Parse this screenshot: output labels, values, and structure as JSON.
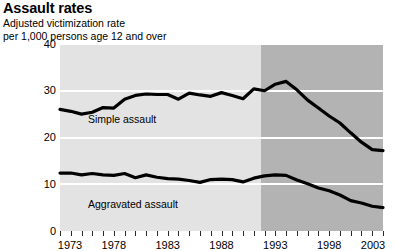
{
  "header": {
    "title": "Assault rates",
    "subtitle_line1": "Adjusted victimization rate",
    "subtitle_line2": "per 1,000 persons age 12 and over"
  },
  "series_labels": {
    "simple": "Simple assault",
    "aggravated": "Aggravated assault"
  },
  "axis": {
    "y_ticks": [
      "40",
      "30",
      "20",
      "10",
      "0"
    ],
    "x_ticks_labeled": [
      "1973",
      "1978",
      "1983",
      "1988",
      "1993",
      "1998",
      "2003"
    ]
  },
  "chart_data": {
    "type": "line",
    "title": "Assault rates",
    "subtitle": "Adjusted victimization rate per 1,000 persons age 12 and over",
    "xlabel": "",
    "ylabel": "",
    "xlim": [
      1973,
      2003
    ],
    "ylim": [
      0,
      40
    ],
    "ytick_values": [
      0,
      10,
      20,
      30,
      40
    ],
    "xtick_values": [
      1973,
      1974,
      1975,
      1976,
      1977,
      1978,
      1979,
      1980,
      1981,
      1982,
      1983,
      1984,
      1985,
      1986,
      1987,
      1988,
      1989,
      1990,
      1991,
      1992,
      1993,
      1994,
      1995,
      1996,
      1997,
      1998,
      1999,
      2000,
      2001,
      2002,
      2003
    ],
    "xtick_labels_shown": [
      1973,
      1978,
      1983,
      1988,
      1993,
      1998,
      2003
    ],
    "grid": "horizontal-white-gridlines",
    "legend": "inline-series-labels",
    "plot_background_light": "#e3e3e3",
    "plot_background_dark": "#b3b3b3",
    "shaded_region_note": "Darker band covers 1993 through 2003 (redesigned survey period)",
    "line_color": "#000000",
    "x": [
      1973,
      1974,
      1975,
      1976,
      1977,
      1978,
      1979,
      1980,
      1981,
      1982,
      1983,
      1984,
      1985,
      1986,
      1987,
      1988,
      1989,
      1990,
      1991,
      1992,
      1993,
      1994,
      1995,
      1996,
      1997,
      1998,
      1999,
      2000,
      2001,
      2002,
      2003
    ],
    "series": [
      {
        "name": "Simple assault",
        "values": [
          26.0,
          25.6,
          25.0,
          25.4,
          26.4,
          26.3,
          28.2,
          29.0,
          29.3,
          29.2,
          29.2,
          28.2,
          29.5,
          29.1,
          28.8,
          29.6,
          29.0,
          28.3,
          30.4,
          30.0,
          31.4,
          32.0,
          30.2,
          28.0,
          26.3,
          24.6,
          23.1,
          21.0,
          19.0,
          17.4,
          17.2
        ]
      },
      {
        "name": "Aggravated assault",
        "values": [
          12.4,
          12.4,
          12.0,
          12.3,
          12.0,
          11.9,
          12.3,
          11.4,
          12.0,
          11.5,
          11.2,
          11.1,
          10.8,
          10.4,
          11.0,
          11.1,
          11.0,
          10.5,
          11.3,
          11.8,
          12.0,
          11.9,
          10.9,
          10.1,
          9.2,
          8.6,
          7.7,
          6.5,
          6.0,
          5.3,
          5.0
        ]
      }
    ]
  }
}
